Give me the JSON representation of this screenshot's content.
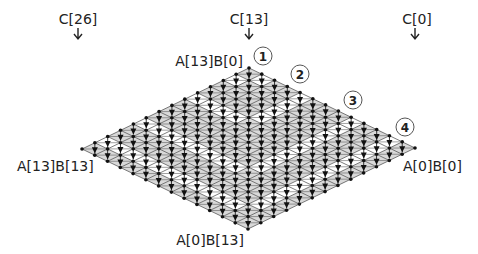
{
  "diagram": {
    "grid_size": 14,
    "vertices": {
      "top": {
        "x": 249,
        "y": 68
      },
      "right": {
        "x": 415,
        "y": 148
      },
      "left": {
        "x": 82,
        "y": 149
      },
      "bottom": {
        "x": 249,
        "y": 230
      }
    },
    "white_band_levels": [
      1,
      4,
      8,
      11
    ],
    "colors": {
      "cell_gray": "#d9d9d9",
      "cell_white": "#ffffff",
      "line": "#444444",
      "dot": "#111111"
    },
    "corner_labels": {
      "top": "A[13]B[0]",
      "right": "A[0]B[0]",
      "left": "A[13]B[13]",
      "bottom": "A[0]B[13]"
    },
    "output_labels": [
      {
        "text": "C[26]",
        "x": 75,
        "y": 25
      },
      {
        "text": "C[13]",
        "x": 249,
        "y": 25
      },
      {
        "text": "C[0]",
        "x": 415,
        "y": 25
      }
    ],
    "steps": [
      {
        "n": "1",
        "x": 263,
        "y": 56
      },
      {
        "n": "2",
        "x": 300,
        "y": 74
      },
      {
        "n": "3",
        "x": 353,
        "y": 100
      },
      {
        "n": "4",
        "x": 405,
        "y": 127
      }
    ]
  }
}
